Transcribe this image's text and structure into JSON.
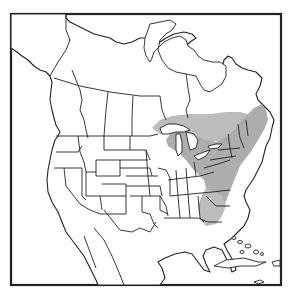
{
  "map": {
    "type": "range-map",
    "region": "North America",
    "shaded_range": {
      "description": "Northeastern United States, Great Lakes region and southeastern Canada, extending south along the Appalachians",
      "fill_color": "#a9a9a9"
    },
    "colors": {
      "background": "#ffffff",
      "outline": "#222222",
      "range": "#a9a9a9"
    },
    "features": [
      "frame-border",
      "coastlines",
      "state-borders",
      "province-borders",
      "great-lakes",
      "hudson-bay",
      "caribbean-islands"
    ]
  }
}
